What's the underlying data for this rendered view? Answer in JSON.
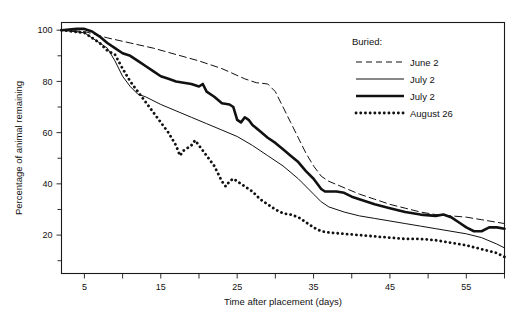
{
  "chart_data": {
    "type": "line",
    "title": "",
    "xlabel": "Time after placement (days)",
    "ylabel": "Percentage of animal remaining",
    "xlim": [
      2,
      60
    ],
    "ylim": [
      5,
      103
    ],
    "grid": false,
    "legend_position": "top-right",
    "legend_title": "Buried:",
    "xticks": [
      5,
      15,
      25,
      35,
      45,
      55
    ],
    "xticks_minor": [
      10,
      20,
      30,
      40,
      50,
      60
    ],
    "yticks": [
      20,
      40,
      60,
      80,
      100
    ],
    "yticks_minor": [
      10,
      30,
      50,
      70,
      90
    ],
    "series": [
      {
        "name": "June 2",
        "style": "dashed",
        "x": [
          2,
          5,
          8,
          11,
          14,
          17,
          20,
          23,
          26,
          27.5,
          29,
          30,
          31,
          32,
          33,
          34,
          35,
          36,
          37,
          39,
          41,
          43,
          45,
          47,
          49,
          51,
          53,
          55,
          57,
          59,
          60
        ],
        "y": [
          100,
          99.5,
          97,
          95,
          93,
          90.5,
          88,
          85,
          81,
          79.5,
          79,
          76,
          70,
          64,
          58,
          52,
          47,
          43,
          41,
          38.5,
          36,
          34,
          32,
          30.5,
          29,
          28,
          27.5,
          27,
          26,
          25,
          24.5
        ]
      },
      {
        "name": "July 2",
        "style": "thin-solid",
        "x": [
          2,
          5,
          8,
          9,
          10,
          11,
          12,
          13,
          15,
          17,
          19,
          21,
          23,
          25,
          27,
          29,
          31,
          33,
          35,
          36,
          37,
          39,
          41,
          43,
          45,
          47,
          49,
          51,
          53,
          55,
          57,
          59,
          60
        ],
        "y": [
          100,
          99,
          93,
          88,
          82,
          78,
          75,
          74,
          71,
          68.5,
          66,
          63.5,
          61,
          58.5,
          55,
          51,
          47,
          42,
          36,
          33,
          31,
          29,
          27.5,
          26.5,
          25.5,
          24.5,
          23.5,
          22.5,
          21.5,
          20.5,
          19,
          16.5,
          15
        ]
      },
      {
        "name": "July 2",
        "style": "thick-solid",
        "x": [
          2,
          4,
          5,
          6,
          7,
          8,
          9,
          10,
          11,
          12,
          13,
          14,
          15,
          16,
          17,
          18,
          19,
          20,
          20.5,
          21,
          22,
          23,
          24,
          24.5,
          25,
          25.5,
          26,
          26.5,
          27,
          28,
          29,
          30,
          31,
          32,
          33,
          34,
          35,
          36,
          36.5,
          38,
          39,
          40,
          41,
          43,
          45,
          47,
          49,
          51,
          52,
          53,
          54,
          55,
          56,
          57,
          58,
          59,
          60
        ],
        "y": [
          100,
          100.5,
          100.5,
          99.5,
          97.5,
          95,
          93,
          91,
          90,
          88,
          86,
          84,
          82,
          81,
          80,
          79.5,
          79,
          78,
          79,
          76,
          74,
          71.5,
          71,
          70,
          65,
          64,
          66,
          65,
          63,
          60.5,
          58,
          56,
          53.5,
          51,
          48.5,
          45,
          42,
          38,
          37,
          37,
          36.5,
          35,
          34,
          32,
          30.5,
          29,
          28,
          27.5,
          28,
          27,
          25,
          23,
          21.5,
          21.5,
          23,
          23,
          22.5
        ]
      },
      {
        "name": "August 26",
        "style": "dotted",
        "x": [
          2,
          5,
          7,
          8,
          9,
          10,
          11,
          12,
          13,
          14,
          15,
          16,
          17,
          17.5,
          18,
          19,
          19.5,
          20,
          21,
          22,
          22.5,
          23,
          23.5,
          24,
          24.5,
          25,
          25.5,
          26,
          27,
          28,
          29,
          30,
          31,
          32,
          33,
          34,
          35,
          36,
          37,
          39,
          41,
          43,
          45,
          47,
          49,
          51,
          53,
          55,
          57,
          59,
          60
        ],
        "y": [
          100,
          99,
          95,
          92,
          90.5,
          85,
          80,
          76,
          72,
          68,
          64,
          60,
          55,
          51,
          53,
          55,
          57,
          55,
          51,
          47,
          44,
          41,
          39,
          41,
          42,
          41,
          40,
          39,
          37,
          34,
          32,
          30,
          28.5,
          28,
          27,
          25,
          23,
          21.5,
          21,
          20.5,
          20,
          19.5,
          19,
          18.5,
          18.5,
          18,
          17,
          16,
          14.5,
          13,
          11.5
        ]
      }
    ]
  },
  "legend": {
    "title": "Buried:",
    "entries": [
      {
        "label": "June 2",
        "style": "dashed"
      },
      {
        "label": "July 2",
        "style": "thin-solid"
      },
      {
        "label": "July 2",
        "style": "thick-solid"
      },
      {
        "label": "August 26",
        "style": "dotted"
      }
    ]
  },
  "axes": {
    "x_title": "Time after placement (days)",
    "y_title": "Percentage of animal remaining",
    "x_tick_labels": [
      "5",
      "15",
      "25",
      "35",
      "45",
      "55"
    ],
    "y_tick_labels": [
      "20",
      "40",
      "60",
      "80",
      "100"
    ]
  },
  "colors": {
    "ink": "#111111",
    "background": "#ffffff"
  }
}
